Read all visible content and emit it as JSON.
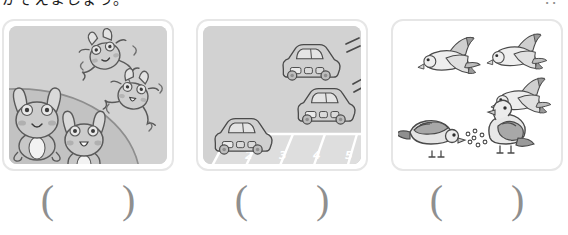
{
  "heading": {
    "text": "かぞえましょう。",
    "right_marks": "．．"
  },
  "panels": [
    {
      "id": "frogs",
      "background": "gray",
      "scene_label": "frogs-scene",
      "subject": "frog",
      "on_ground_count": 2,
      "in_air_count": 2,
      "total_count": 4,
      "answer": "(　)"
    },
    {
      "id": "cars",
      "background": "gray",
      "scene_label": "parking-lot-scene",
      "subject": "car",
      "parked_count": 1,
      "arriving_count": 2,
      "total_count": 3,
      "space_numbers": [
        "2",
        "3",
        "4",
        "5"
      ],
      "answer": "(　)"
    },
    {
      "id": "birds",
      "background": "white",
      "scene_label": "birds-scene",
      "subject": "pigeon",
      "flying_count": 3,
      "ground_count": 2,
      "total_count": 5,
      "seed_count": 7,
      "answer": "(　)"
    }
  ],
  "colors": {
    "panel_border": "#e6e6e6",
    "panel_fill_gray": "#d2d2d2",
    "panel_fill_white": "#ffffff",
    "ink": "#4a4a4a",
    "body_light": "#e3e3e3",
    "body_mid": "#bdbdbd",
    "body_dark": "#9a9a9a",
    "answer_text": "#8f8f8f",
    "space_number": "#ffffff"
  }
}
